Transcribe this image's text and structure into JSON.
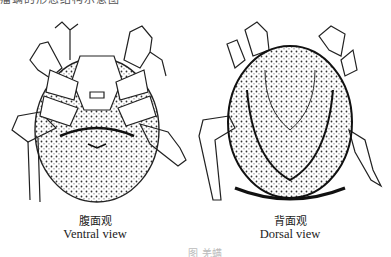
{
  "header": {
    "cut_text": "瘤螨的形态结构示意图"
  },
  "figures": [
    {
      "label_zh": "腹面观",
      "label_en": "Ventral view"
    },
    {
      "label_zh": "背面观",
      "label_en": "Dorsal view"
    }
  ],
  "figure_caption": "图    羌螨"
}
